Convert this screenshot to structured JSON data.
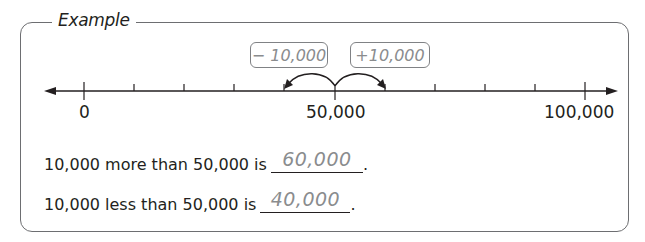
{
  "frame": {
    "title": "Example"
  },
  "number_line": {
    "min": 0,
    "max": 100000,
    "step": 10000,
    "labels": [
      {
        "value": 0,
        "text": "0"
      },
      {
        "value": 50000,
        "text": "50,000"
      },
      {
        "value": 100000,
        "text": "100,000"
      }
    ],
    "operations": [
      {
        "label": "− 10,000",
        "from": 50000,
        "to": 40000
      },
      {
        "label": "+10,000",
        "from": 50000,
        "to": 60000
      }
    ]
  },
  "sentences": [
    {
      "prompt": "10,000 more than 50,000 is",
      "answer": "60,000",
      "end": "."
    },
    {
      "prompt": "10,000 less than 50,000 is",
      "answer": "40,000",
      "end": "."
    }
  ],
  "colors": {
    "ink": "#231f20",
    "answer_gray": "#8a8c8e",
    "frame": "#6d6e71"
  }
}
